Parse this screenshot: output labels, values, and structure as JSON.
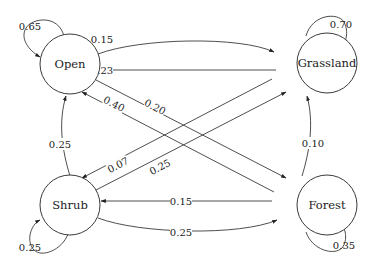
{
  "diagram": {
    "type": "state-transition",
    "nodes": [
      {
        "id": "open",
        "label": "Open"
      },
      {
        "id": "grassland",
        "label": "Grassland"
      },
      {
        "id": "shrub",
        "label": "Shrub"
      },
      {
        "id": "forest",
        "label": "Forest"
      }
    ],
    "edges": [
      {
        "from": "Open",
        "to": "Open",
        "label": "0.65"
      },
      {
        "from": "Grassland",
        "to": "Grassland",
        "label": "0.70"
      },
      {
        "from": "Shrub",
        "to": "Shrub",
        "label": "0.25"
      },
      {
        "from": "Forest",
        "to": "Forest",
        "label": "0.35"
      },
      {
        "from": "Open",
        "to": "Grassland",
        "label": "0.15"
      },
      {
        "from": "Grassland",
        "to": "Open",
        "label": "0.23"
      },
      {
        "from": "Open",
        "to": "Forest",
        "label": "0.20"
      },
      {
        "from": "Forest",
        "to": "Open",
        "label": "0.40"
      },
      {
        "from": "Grassland",
        "to": "Shrub",
        "label": "0.07"
      },
      {
        "from": "Shrub",
        "to": "Grassland",
        "label": "0.25"
      },
      {
        "from": "Shrub",
        "to": "Open",
        "label": "0.25"
      },
      {
        "from": "Forest",
        "to": "Grassland",
        "label": "0.10"
      },
      {
        "from": "Forest",
        "to": "Shrub",
        "label": "0.15"
      },
      {
        "from": "Shrub",
        "to": "Forest",
        "label": "0.25"
      }
    ]
  }
}
